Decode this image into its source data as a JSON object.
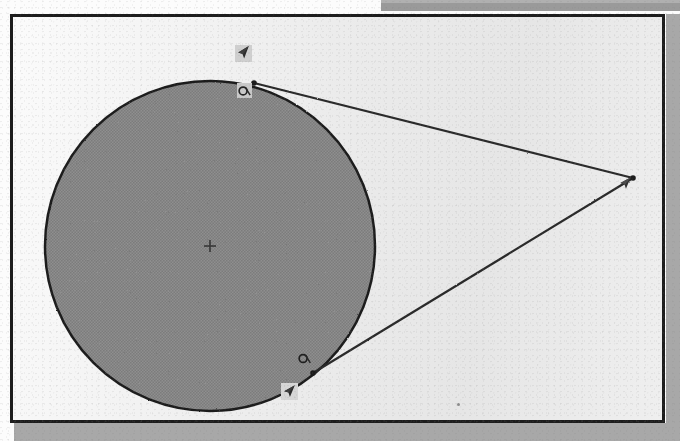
{
  "document": {
    "kind": "scanned-geometry-diagram",
    "caption": "Circle with two tangent lines from an external point"
  },
  "canvas": {
    "background_color": "#eeeeee",
    "border_color": "#1d1d1d",
    "page_color": "#fcfcfc",
    "shadow_color": "#a8a8a8"
  },
  "chart_data": {
    "type": "scatter",
    "xlabel": "",
    "ylabel": "",
    "grid": false,
    "legend": null,
    "shapes": [
      {
        "name": "circle",
        "type": "circle",
        "center": [
          202,
          235
        ],
        "radius": 165,
        "fill": "#8a8a8a",
        "stroke": "#1e1e1e",
        "stroke_width": 2.5
      },
      {
        "name": "tangent-line-upper",
        "type": "line",
        "from": [
          246,
          72
        ],
        "to": [
          625,
          167
        ],
        "stroke": "#2a2a2a",
        "stroke_width": 2.2
      },
      {
        "name": "tangent-line-lower",
        "type": "line",
        "from": [
          305,
          362
        ],
        "to": [
          625,
          167
        ],
        "stroke": "#2a2a2a",
        "stroke_width": 2.2
      }
    ],
    "points": [
      {
        "name": "circle-center",
        "x": 202,
        "y": 235,
        "marker": "plus",
        "label": ""
      },
      {
        "name": "tangent-point-upper",
        "x": 246,
        "y": 72,
        "marker": "dot",
        "label": ""
      },
      {
        "name": "tangent-point-lower",
        "x": 305,
        "y": 362,
        "marker": "dot",
        "label": ""
      },
      {
        "name": "apex-external-point",
        "x": 625,
        "y": 167,
        "marker": "dot",
        "label": ""
      }
    ]
  },
  "markers": {
    "cursor_upper": {
      "name": "arrow-cursor",
      "x": 232,
      "y": 42
    },
    "handle_upper": {
      "name": "point-handle",
      "x": 233,
      "y": 80
    },
    "cursor_apex": {
      "name": "arrow-cursor",
      "x": 617,
      "y": 172
    },
    "handle_lower": {
      "name": "point-handle",
      "x": 295,
      "y": 348
    },
    "cursor_lower": {
      "name": "arrow-cursor",
      "x": 280,
      "y": 381
    }
  }
}
